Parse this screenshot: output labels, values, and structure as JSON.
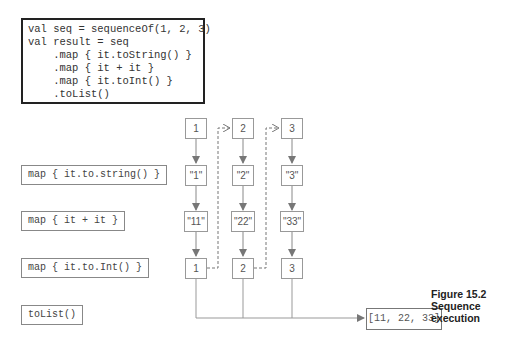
{
  "code": {
    "lines": [
      "val seq = sequenceOf(1, 2, 3)",
      "val result = seq",
      "    .map { it.toString() }",
      "    .map { it + it }",
      "    .map { it.toInt() }",
      "    .toList()"
    ]
  },
  "stages": [
    {
      "label": "map { it.to.string() }"
    },
    {
      "label": "map { it + it }"
    },
    {
      "label": "map { it.to.Int() }"
    },
    {
      "label": "toList()"
    }
  ],
  "columns": [
    {
      "input": "1",
      "to_string": "\"1\"",
      "doubled": "\"11\"",
      "to_int": "1"
    },
    {
      "input": "2",
      "to_string": "\"2\"",
      "doubled": "\"22\"",
      "to_int": "2"
    },
    {
      "input": "3",
      "to_string": "\"3\"",
      "doubled": "\"33\"",
      "to_int": "3"
    }
  ],
  "result": "[11, 22, 33]",
  "caption": {
    "line1": "Figure 15.2",
    "line2": "Sequence",
    "line3": "execution"
  }
}
